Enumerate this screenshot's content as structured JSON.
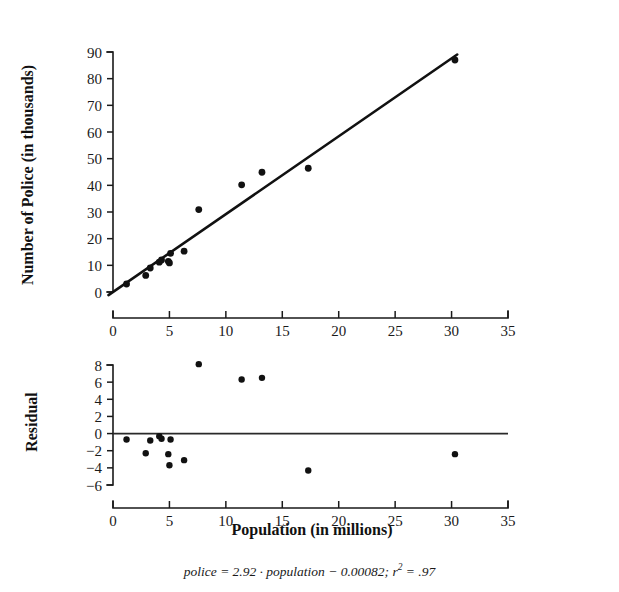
{
  "figure": {
    "caption_main": "police = 2.92 · population − 0.00082; r",
    "caption_sup": "2",
    "caption_tail": " = .97",
    "ink_color": "#111111",
    "background_color": "#ffffff"
  },
  "chart_data": [
    {
      "type": "scatter",
      "id": "police-vs-population",
      "title": "",
      "xlabel": "",
      "ylabel": "Number of Police (in thousands)",
      "xlim": [
        0,
        35
      ],
      "ylim": [
        0,
        90
      ],
      "xticks": [
        0,
        5,
        10,
        15,
        20,
        25,
        30,
        35
      ],
      "yticks": [
        0,
        10,
        20,
        30,
        40,
        50,
        60,
        70,
        80,
        90
      ],
      "xticklabels": [
        "0",
        "5",
        "10",
        "15",
        "20",
        "25",
        "30",
        "35"
      ],
      "yticklabels": [
        "0",
        "10",
        "20",
        "30",
        "40",
        "50",
        "60",
        "70",
        "80",
        "90"
      ],
      "grid": false,
      "legend": false,
      "x": [
        1.2,
        2.9,
        3.3,
        4.1,
        4.3,
        4.9,
        5.0,
        5.1,
        6.3,
        7.6,
        11.4,
        13.2,
        17.3,
        30.3
      ],
      "y": [
        3.0,
        6.2,
        9.0,
        11.2,
        12.0,
        11.5,
        10.9,
        14.5,
        15.3,
        30.9,
        40.2,
        44.9,
        46.4,
        87.0
      ],
      "fit_line": {
        "label": "least-squares regression line",
        "slope": 2.92,
        "intercept": -0.00082,
        "x_start": -0.4,
        "x_end": 30.5
      }
    },
    {
      "type": "scatter",
      "id": "residual-plot",
      "title": "",
      "xlabel": "Population (in millions)",
      "ylabel": "Residual",
      "xlim": [
        0,
        35
      ],
      "ylim": [
        -6,
        8
      ],
      "xticks": [
        0,
        5,
        10,
        15,
        20,
        25,
        30,
        35
      ],
      "yticks": [
        -6,
        -4,
        -2,
        0,
        2,
        4,
        6,
        8
      ],
      "xticklabels": [
        "0",
        "5",
        "10",
        "15",
        "20",
        "25",
        "30",
        "35"
      ],
      "yticklabels": [
        "−6",
        "−4",
        "−2",
        "0",
        "2",
        "4",
        "6",
        "8"
      ],
      "grid": false,
      "legend": false,
      "zero_reference_line": 0,
      "x": [
        1.2,
        2.9,
        3.3,
        4.1,
        4.3,
        4.9,
        5.0,
        5.1,
        6.3,
        7.6,
        11.4,
        13.2,
        17.3,
        30.3
      ],
      "y": [
        -0.7,
        -2.3,
        -0.8,
        -0.3,
        -0.6,
        -2.4,
        -3.7,
        -0.7,
        -3.1,
        8.1,
        6.3,
        6.5,
        -4.3,
        -2.4
      ]
    }
  ]
}
